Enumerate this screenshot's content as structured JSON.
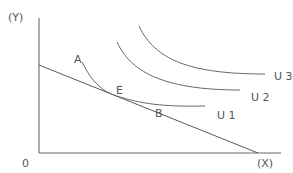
{
  "diagram": {
    "type": "indifference-curve-budget-line",
    "axes": {
      "y_label": "(Y)",
      "x_label": "(X)",
      "origin_label": "0"
    },
    "curves": [
      {
        "id": "U1",
        "label": "U 1"
      },
      {
        "id": "U2",
        "label": "U 2"
      },
      {
        "id": "U3",
        "label": "U 3"
      }
    ],
    "points": [
      {
        "id": "A",
        "label": "A"
      },
      {
        "id": "E",
        "label": "E",
        "note": "tangency of U1 and budget line"
      },
      {
        "id": "B",
        "label": "B"
      }
    ],
    "budget_line": {
      "label": ""
    },
    "colors": {
      "line": "#6a6a6a",
      "text": "#555555",
      "background": "#ffffff"
    }
  }
}
